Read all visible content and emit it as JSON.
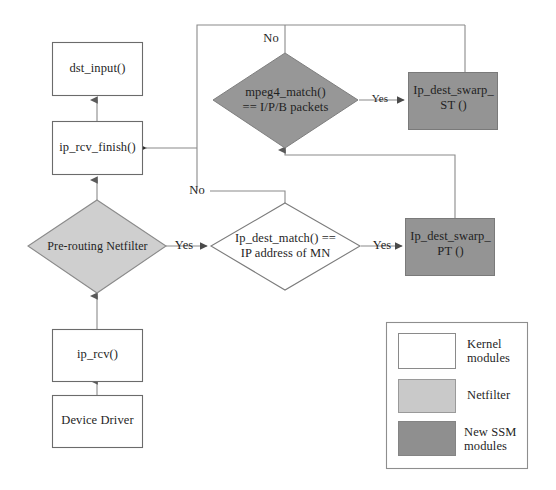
{
  "diagram": {
    "colors": {
      "kernel_fill": "#ffffff",
      "netfilter_fill": "#c9c9c9",
      "ssm_fill": "#8f8f8f",
      "stroke": "#545454",
      "text": "#1f1f1f",
      "background": "#ffffff"
    },
    "nodes": [
      {
        "id": "dst_input",
        "kind": "process",
        "style": "kernel",
        "label": "dst_input()"
      },
      {
        "id": "ip_rcv_finish",
        "kind": "process",
        "style": "kernel",
        "label": "ip_rcv_finish()"
      },
      {
        "id": "pre_routing",
        "kind": "decision",
        "style": "netfilter",
        "label": "Pre-routing Netfilter"
      },
      {
        "id": "ip_rcv",
        "kind": "process",
        "style": "kernel",
        "label": "ip_rcv()"
      },
      {
        "id": "device_driver",
        "kind": "process",
        "style": "kernel",
        "label": "Device Driver"
      },
      {
        "id": "mpeg4_match",
        "kind": "decision",
        "style": "ssm",
        "label_line1": "mpeg4_match()",
        "label_line2": "== I/P/B packets"
      },
      {
        "id": "ip_dest_match",
        "kind": "decision",
        "style": "kernel",
        "label_line1": "Ip_dest_match() ==",
        "label_line2": "IP address of MN"
      },
      {
        "id": "ip_dest_swarp_st",
        "kind": "process",
        "style": "ssm",
        "label_line1": "Ip_dest_swarp_",
        "label_line2": "ST ()"
      },
      {
        "id": "ip_dest_swarp_pt",
        "kind": "process",
        "style": "ssm",
        "label_line1": "Ip_dest_swarp_",
        "label_line2": "PT ()"
      }
    ],
    "edge_labels": {
      "mpeg4_no": "No",
      "mpeg4_yes": "Yes",
      "dest_match_no": "No",
      "dest_match_yes": "Yes",
      "pre_routing_yes": "Yes"
    }
  },
  "legend": {
    "items": [
      {
        "swatch": "kernel",
        "label": "Kernel\nmodules"
      },
      {
        "swatch": "netfilter",
        "label": "Netfilter"
      },
      {
        "swatch": "ssm",
        "label": "New SSM\nmodules"
      }
    ]
  }
}
